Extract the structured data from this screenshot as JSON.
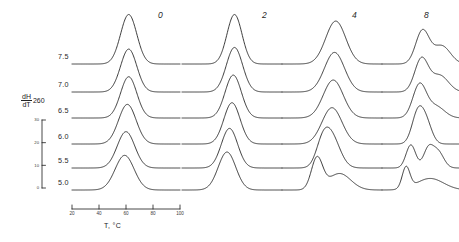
{
  "figure": {
    "yaxis": {
      "label_numerator": "dH",
      "label_numerator_sub": "260",
      "label_denominator": "dT",
      "label_full": "dH260/dT",
      "ticks": [
        "30",
        "20",
        "10",
        "0"
      ],
      "tick_values": [
        30,
        20,
        10,
        0
      ],
      "range": [
        0,
        30
      ]
    },
    "xaxis": {
      "title": "T, °C",
      "ticks": [
        "20",
        "40",
        "60",
        "80",
        "100"
      ],
      "tick_values": [
        20,
        40,
        60,
        80,
        100
      ],
      "range": [
        20,
        100
      ],
      "unit": "°C"
    },
    "column_headers": [
      "0",
      "2",
      "4",
      "8"
    ],
    "row_labels": [
      "7.5",
      "7.0",
      "6.5",
      "6.0",
      "5.5",
      "5.0"
    ],
    "line_color": "#1a1a1a"
  },
  "chart_data": {
    "type": "line",
    "title": "",
    "xlabel": "T, °C",
    "ylabel": "dH260/dT",
    "xlim": [
      20,
      100
    ],
    "ylim": [
      0,
      30
    ],
    "grid": false,
    "legend": "none",
    "layout": "small-multiples grid, 4 columns x 6 stacked offset traces",
    "column_headers": [
      "0",
      "2",
      "4",
      "8"
    ],
    "row_labels": [
      "7.5",
      "7.0",
      "6.5",
      "6.0",
      "5.5",
      "5.0"
    ],
    "panels": [
      {
        "column_header": "0",
        "traces": [
          {
            "row_label": "7.5",
            "peaks": [
              {
                "center": 62,
                "height": 30,
                "width": 6
              }
            ]
          },
          {
            "row_label": "7.0",
            "peaks": [
              {
                "center": 62,
                "height": 26,
                "width": 6
              }
            ]
          },
          {
            "row_label": "6.5",
            "peaks": [
              {
                "center": 62,
                "height": 25,
                "width": 6
              }
            ]
          },
          {
            "row_label": "6.0",
            "peaks": [
              {
                "center": 61,
                "height": 24,
                "width": 6.5
              }
            ]
          },
          {
            "row_label": "5.5",
            "peaks": [
              {
                "center": 60,
                "height": 22,
                "width": 6.5
              }
            ]
          },
          {
            "row_label": "5.0",
            "peaks": [
              {
                "center": 59,
                "height": 21,
                "width": 7
              }
            ]
          }
        ]
      },
      {
        "column_header": "2",
        "traces": [
          {
            "row_label": "7.5",
            "peaks": [
              {
                "center": 62,
                "height": 30,
                "width": 6
              }
            ]
          },
          {
            "row_label": "7.0",
            "peaks": [
              {
                "center": 62,
                "height": 27,
                "width": 6.5
              }
            ]
          },
          {
            "row_label": "6.5",
            "peaks": [
              {
                "center": 61,
                "height": 26,
                "width": 6.5
              }
            ]
          },
          {
            "row_label": "6.0",
            "peaks": [
              {
                "center": 60,
                "height": 25,
                "width": 6.5
              }
            ]
          },
          {
            "row_label": "5.5",
            "peaks": [
              {
                "center": 58,
                "height": 24,
                "width": 6.5
              }
            ]
          },
          {
            "row_label": "5.0",
            "peaks": [
              {
                "center": 56,
                "height": 23,
                "width": 7
              }
            ]
          }
        ]
      },
      {
        "column_header": "4",
        "traces": [
          {
            "row_label": "7.5",
            "peaks": [
              {
                "center": 63,
                "height": 26,
                "width": 8
              }
            ]
          },
          {
            "row_label": "7.0",
            "peaks": [
              {
                "center": 62,
                "height": 24,
                "width": 8
              }
            ]
          },
          {
            "row_label": "6.5",
            "peaks": [
              {
                "center": 61,
                "height": 23,
                "width": 8
              }
            ]
          },
          {
            "row_label": "6.0",
            "peaks": [
              {
                "center": 60,
                "height": 22,
                "width": 8
              }
            ]
          },
          {
            "row_label": "5.5",
            "peaks": [
              {
                "center": 52,
                "height": 9,
                "width": 5
              },
              {
                "center": 59,
                "height": 20,
                "width": 7
              }
            ]
          },
          {
            "row_label": "5.0",
            "peaks": [
              {
                "center": 48,
                "height": 19,
                "width": 4.5
              },
              {
                "center": 66,
                "height": 10,
                "width": 9
              }
            ]
          }
        ]
      },
      {
        "column_header": "8",
        "traces": [
          {
            "row_label": "7.5",
            "peaks": [
              {
                "center": 62,
                "height": 20,
                "width": 7
              },
              {
                "center": 82,
                "height": 11,
                "width": 9
              }
            ]
          },
          {
            "row_label": "7.0",
            "peaks": [
              {
                "center": 61,
                "height": 20,
                "width": 7
              },
              {
                "center": 80,
                "height": 10,
                "width": 9
              }
            ]
          },
          {
            "row_label": "6.5",
            "peaks": [
              {
                "center": 59,
                "height": 20,
                "width": 7
              },
              {
                "center": 76,
                "height": 7,
                "width": 9
              }
            ]
          },
          {
            "row_label": "6.0",
            "peaks": [
              {
                "center": 57,
                "height": 18,
                "width": 6
              },
              {
                "center": 66,
                "height": 12,
                "width": 6
              }
            ]
          },
          {
            "row_label": "5.5",
            "peaks": [
              {
                "center": 50,
                "height": 14,
                "width": 5
              },
              {
                "center": 68,
                "height": 11,
                "width": 5
              },
              {
                "center": 78,
                "height": 10,
                "width": 6
              }
            ]
          },
          {
            "row_label": "5.0",
            "peaks": [
              {
                "center": 45,
                "height": 13,
                "width": 4
              },
              {
                "center": 70,
                "height": 7,
                "width": 14
              }
            ]
          }
        ]
      }
    ]
  }
}
